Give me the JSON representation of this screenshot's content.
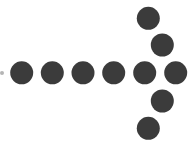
{
  "graphic": {
    "description": "dotted-arrow-pointing-right",
    "dot_color": "#3b3b3b",
    "faint_dot_color": "#b5b5b5",
    "dot_radius": 11.5,
    "faint_dot": {
      "cx": 2,
      "cy": 73,
      "r": 2
    },
    "shaft_dots": [
      {
        "cx": 21.7,
        "cy": 72.8
      },
      {
        "cx": 52.3,
        "cy": 72.8
      },
      {
        "cx": 83.0,
        "cy": 72.8
      },
      {
        "cx": 113.7,
        "cy": 72.8
      },
      {
        "cx": 144.7,
        "cy": 72.8
      },
      {
        "cx": 175.7,
        "cy": 72.8
      }
    ],
    "head_upper_dots": [
      {
        "cx": 148.3,
        "cy": 18.3
      },
      {
        "cx": 162.3,
        "cy": 45.0
      }
    ],
    "head_lower_dots": [
      {
        "cx": 162.3,
        "cy": 101.0
      },
      {
        "cx": 148.3,
        "cy": 128.3
      }
    ]
  }
}
